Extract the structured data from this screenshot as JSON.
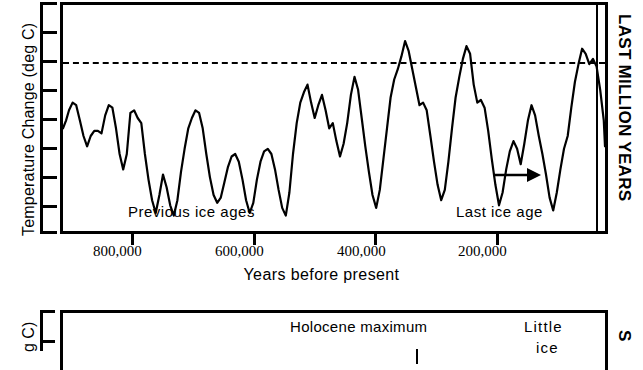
{
  "figure": {
    "title_top_right": "LAST MILLION YEARS",
    "title_bottom_right": "S"
  },
  "top_panel": {
    "y_axis_label": "Temperature Change (deg C)",
    "x_axis_label": "Years before present",
    "x_tick_labels": [
      "800,000",
      "600,000",
      "400,000",
      "200,000"
    ],
    "annotations": {
      "previous_ice_ages": "Previous ice ages",
      "last_ice_age": "Last ice age"
    },
    "arrow_icon": "right-arrow-icon"
  },
  "bottom_panel": {
    "y_axis_label": "g C)",
    "annotations": {
      "holocene_maximum": "Holocene maximum",
      "little": "Little",
      "ice": "ice"
    }
  },
  "chart_data": {
    "type": "line",
    "title": "LAST MILLION YEARS",
    "xlabel": "Years before present",
    "ylabel": "Temperature Change (deg C)",
    "xlim": [
      900000,
      0
    ],
    "x_ticks": [
      800000,
      600000,
      400000,
      200000
    ],
    "x_tick_labels": [
      "800,000",
      "600,000",
      "400,000",
      "200,000"
    ],
    "y_ticks_count": 8,
    "y_tick_labels": [],
    "grid": false,
    "legend": null,
    "reference_line": {
      "y": 0,
      "style": "dashed",
      "label": "present-day temperature"
    },
    "vertical_marker_x": 15000,
    "annotations": [
      {
        "text": "Previous ice ages",
        "x": 690000,
        "y": -6.2
      },
      {
        "text": "Last ice age",
        "x": 70000,
        "y": -6.2,
        "arrow": true
      }
    ],
    "series": [
      {
        "name": "Temperature change",
        "units": "deg C",
        "x": [
          900000,
          895000,
          890000,
          884000,
          878000,
          872000,
          866000,
          860000,
          854000,
          848000,
          842000,
          836000,
          830000,
          824000,
          818000,
          812000,
          806000,
          800000,
          794000,
          788000,
          782000,
          776000,
          770000,
          764000,
          758000,
          752000,
          746000,
          740000,
          734000,
          728000,
          722000,
          716000,
          710000,
          704000,
          698000,
          692000,
          686000,
          680000,
          674000,
          668000,
          662000,
          656000,
          650000,
          644000,
          638000,
          632000,
          626000,
          620000,
          614000,
          608000,
          602000,
          596000,
          590000,
          584000,
          578000,
          572000,
          566000,
          560000,
          554000,
          548000,
          542000,
          536000,
          530000,
          524000,
          518000,
          512000,
          506000,
          500000,
          494000,
          488000,
          482000,
          476000,
          470000,
          464000,
          458000,
          452000,
          446000,
          440000,
          434000,
          428000,
          422000,
          416000,
          410000,
          404000,
          398000,
          392000,
          386000,
          380000,
          374000,
          368000,
          362000,
          356000,
          350000,
          344000,
          338000,
          332000,
          326000,
          320000,
          314000,
          308000,
          302000,
          296000,
          290000,
          284000,
          278000,
          272000,
          266000,
          260000,
          254000,
          248000,
          242000,
          236000,
          230000,
          224000,
          218000,
          212000,
          206000,
          200000,
          194000,
          188000,
          182000,
          176000,
          170000,
          164000,
          158000,
          152000,
          146000,
          140000,
          134000,
          128000,
          122000,
          116000,
          110000,
          104000,
          98000,
          92000,
          86000,
          80000,
          74000,
          68000,
          62000,
          56000,
          50000,
          44000,
          38000,
          32000,
          26000,
          20000,
          14000,
          8000,
          2000,
          0
        ],
        "y": [
          -2.6,
          -2.3,
          -1.9,
          -1.6,
          -1.7,
          -2.3,
          -2.9,
          -3.3,
          -2.9,
          -2.7,
          -2.7,
          -2.8,
          -2.1,
          -1.7,
          -1.8,
          -2.6,
          -3.6,
          -4.2,
          -3.6,
          -2.0,
          -1.9,
          -2.2,
          -2.4,
          -3.6,
          -4.6,
          -5.4,
          -5.9,
          -5.2,
          -4.4,
          -4.9,
          -5.6,
          -6.0,
          -5.4,
          -4.3,
          -3.4,
          -2.6,
          -2.2,
          -1.9,
          -2.0,
          -2.6,
          -3.6,
          -4.5,
          -5.2,
          -5.5,
          -5.3,
          -4.7,
          -4.1,
          -3.7,
          -3.6,
          -3.9,
          -4.6,
          -5.4,
          -5.9,
          -5.5,
          -4.6,
          -3.9,
          -3.5,
          -3.4,
          -3.6,
          -4.2,
          -5.0,
          -5.7,
          -6.0,
          -5.1,
          -3.6,
          -2.4,
          -1.6,
          -1.2,
          -0.9,
          -1.6,
          -2.2,
          -1.7,
          -1.3,
          -1.9,
          -2.6,
          -2.4,
          -3.1,
          -3.7,
          -3.2,
          -2.4,
          -1.3,
          -0.6,
          -1.1,
          -2.2,
          -3.3,
          -4.3,
          -5.2,
          -5.7,
          -5.0,
          -3.8,
          -2.6,
          -1.4,
          -0.7,
          -0.3,
          0.2,
          0.8,
          0.4,
          -0.3,
          -1.0,
          -1.7,
          -1.6,
          -1.9,
          -2.9,
          -3.9,
          -4.8,
          -5.4,
          -5.0,
          -3.9,
          -2.6,
          -1.4,
          -0.6,
          0.1,
          0.6,
          0.3,
          -0.9,
          -1.6,
          -1.5,
          -1.8,
          -2.7,
          -3.8,
          -4.8,
          -5.6,
          -5.1,
          -4.2,
          -3.5,
          -3.1,
          -3.4,
          -4.0,
          -3.2,
          -2.3,
          -1.7,
          -2.1,
          -2.9,
          -3.6,
          -4.4,
          -5.3,
          -5.8,
          -5.1,
          -4.2,
          -3.4,
          -2.9,
          -1.8,
          -0.8,
          -0.1,
          0.5,
          0.3,
          -0.1,
          0.1,
          -0.2,
          -1.1,
          -2.3,
          -3.3
        ]
      }
    ]
  }
}
